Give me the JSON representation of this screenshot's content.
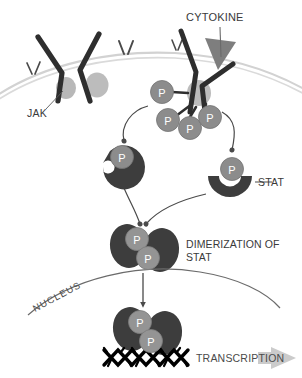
{
  "figure": {
    "type": "biological-pathway-diagram",
    "background_color": "#ffffff"
  },
  "labels": {
    "cytokine": "CYTOKINE",
    "jak": "JAK",
    "stat": "STAT",
    "dimerization_line1": "DIMERIZATION OF",
    "dimerization_line2": "STAT",
    "nucleus": "NUCLEUS",
    "transcription": "TRANSCRIPTION",
    "phosphate": "P"
  },
  "colors": {
    "protein_dark": "#3d3d3d",
    "phosphate_fill": "#8c8c8c",
    "phosphate_stroke": "#6f6f6f",
    "receptor_dark": "#333333",
    "jak_blob": "#b8b8b8",
    "cytokine_fill": "#7e7e7e",
    "membrane_line": "#cfcfcf",
    "nucleus_line": "#6b6b6b",
    "arrow_line": "#4a4a4a",
    "transcription_arrow": "#cccccc",
    "dna_strand": "#000000",
    "text": "#3a3a3a"
  },
  "elements": {
    "cell_membrane": {
      "name": "cell-membrane-bilayer",
      "description": "light gray double-line arc spanning the upper portion"
    },
    "nuclear_membrane": {
      "name": "nuclear-membrane",
      "description": "gray arc across the lower portion"
    },
    "cytokine_ligand": {
      "name": "cytokine-ligand",
      "shape": "triangle-wedge"
    },
    "dna": {
      "name": "dna-double-helix",
      "shape": "black zigzag double strand"
    },
    "transcription_arrow": {
      "name": "transcription-arrow",
      "direction": "right"
    }
  },
  "phosphates": [
    {
      "id": "p-receptor-left",
      "cx": 162,
      "cy": 92,
      "r": 11.5
    },
    {
      "id": "p-receptor-lower",
      "cx": 168,
      "cy": 120,
      "r": 11.5
    },
    {
      "id": "p-receptor-mid",
      "cx": 190,
      "cy": 128,
      "r": 11.5
    },
    {
      "id": "p-receptor-right",
      "cx": 210,
      "cy": 117,
      "r": 11.5
    },
    {
      "id": "p-stat-left",
      "cx": 122,
      "cy": 157,
      "r": 11.5
    },
    {
      "id": "p-stat-right",
      "cx": 232,
      "cy": 169,
      "r": 11.5
    },
    {
      "id": "p-dimer-upper",
      "cx": 137,
      "cy": 239,
      "r": 11.5
    },
    {
      "id": "p-dimer-lower",
      "cx": 148,
      "cy": 256,
      "r": 11.5
    },
    {
      "id": "p-nuclear-upper",
      "cx": 140,
      "cy": 322,
      "r": 11.5
    },
    {
      "id": "p-nuclear-lower",
      "cx": 150,
      "cy": 339,
      "r": 11.5
    }
  ],
  "stat_proteins": [
    {
      "id": "stat-cytoplasm-left",
      "notch": "right"
    },
    {
      "id": "stat-cytoplasm-right",
      "notch": "top"
    },
    {
      "id": "stat-dimer-left"
    },
    {
      "id": "stat-dimer-right"
    },
    {
      "id": "stat-nuclear-left"
    },
    {
      "id": "stat-nuclear-right"
    }
  ],
  "receptors": [
    {
      "id": "receptor-left-unbound-a"
    },
    {
      "id": "receptor-left-unbound-b"
    },
    {
      "id": "receptor-bound-pair"
    }
  ]
}
